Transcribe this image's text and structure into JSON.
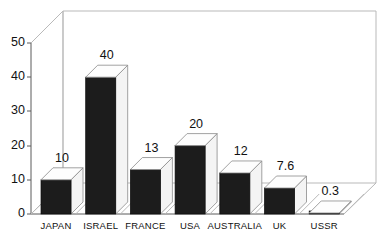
{
  "chart_data": {
    "type": "bar",
    "title": "",
    "subtitle": "",
    "xlabel": "",
    "ylabel": "",
    "categories": [
      "JAPAN",
      "ISRAEL",
      "FRANCE",
      "USA",
      "AUSTRALIA",
      "UK",
      "USSR"
    ],
    "values": [
      10,
      40,
      13,
      20,
      12,
      7.6,
      0.3
    ],
    "value_labels": [
      "10",
      "40",
      "13",
      "20",
      "12",
      "7.6",
      "0.3"
    ],
    "ylim": [
      0,
      50
    ],
    "yticks": [
      0,
      10,
      20,
      30,
      40,
      50
    ],
    "ytick_labels": [
      "0",
      "10",
      "20",
      "30",
      "40",
      "50"
    ],
    "grid": false,
    "legend": false,
    "legend_position": "none",
    "style": "3d-column",
    "series": [
      {
        "name": "",
        "values": [
          10,
          40,
          13,
          20,
          12,
          7.6,
          0.3
        ]
      }
    ],
    "colors": {
      "bar_front": "#1c1c1c",
      "bar_top": "#fdfdfd",
      "bar_side": "#f4f4f4",
      "frame": "#b9b9b9",
      "axis": "#5a5a5a",
      "background": "#ffffff",
      "text": "#111111"
    }
  }
}
